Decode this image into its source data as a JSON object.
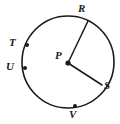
{
  "figure": {
    "kind": "circle-diagram",
    "background_color": "#ffffff",
    "stroke_color": "#1a1a1a",
    "label_color": "#1a1a1a",
    "circle": {
      "center_x": 68,
      "center_y": 62,
      "radius": 46,
      "stroke_width": 1.6
    },
    "center_point": {
      "name": "P",
      "label": "P",
      "x": 68,
      "y": 63,
      "dot_radius": 2.6,
      "label_x": 55,
      "label_y": 50
    },
    "radii": [
      {
        "name": "PR",
        "from": "P",
        "to": "R",
        "x1": 68,
        "y1": 63,
        "x2": 88,
        "y2": 21
      },
      {
        "name": "PS",
        "from": "P",
        "to": "S",
        "x1": 68,
        "y1": 63,
        "x2": 102,
        "y2": 85
      }
    ],
    "points": [
      {
        "name": "R",
        "label": "R",
        "x": 88,
        "y": 21,
        "dot": false,
        "label_x": 78,
        "label_y": 3
      },
      {
        "name": "S",
        "label": "S",
        "x": 102,
        "y": 85,
        "dot": false,
        "label_x": 103,
        "label_y": 85
      },
      {
        "name": "T",
        "label": "T",
        "x": 27,
        "y": 45,
        "dot": true,
        "dot_radius": 2.0,
        "label_x": 9,
        "label_y": 37
      },
      {
        "name": "U",
        "label": "U",
        "x": 25,
        "y": 68,
        "dot": true,
        "dot_radius": 2.0,
        "label_x": 7,
        "label_y": 61
      },
      {
        "name": "V",
        "label": "V",
        "x": 75,
        "y": 106,
        "dot": true,
        "dot_radius": 2.0,
        "label_x": 69,
        "label_y": 108
      }
    ]
  }
}
